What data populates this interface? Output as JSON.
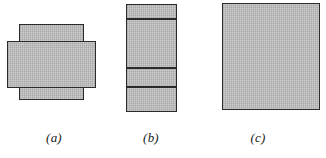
{
  "figure": {
    "type": "geometry-diagram",
    "background_color": "#ffffff",
    "fill_color": "#b5b5b5",
    "stroke_color": "#2b2b2b",
    "panels": [
      {
        "id": "a",
        "caption": "(a)",
        "caption_x": 38,
        "caption_y": 130,
        "caption_width": 32,
        "description": "two overlapping shaded rectangles",
        "shapes": [
          {
            "name": "tall-rectangle",
            "x": 19,
            "y": 24,
            "width": 65,
            "height": 76
          },
          {
            "name": "wide-rectangle",
            "x": 7,
            "y": 41,
            "width": 89,
            "height": 47
          }
        ],
        "dividers": []
      },
      {
        "id": "b",
        "caption": "(b)",
        "caption_x": 135,
        "caption_y": 130,
        "caption_width": 32,
        "description": "tall shaded rectangle split into four horizontal bands",
        "shapes": [
          {
            "name": "banded-rectangle",
            "x": 126,
            "y": 4,
            "width": 51,
            "height": 108
          }
        ],
        "dividers": [
          13,
          62,
          81
        ]
      },
      {
        "id": "c",
        "caption": "(c)",
        "caption_x": 242,
        "caption_y": 130,
        "caption_width": 32,
        "description": "single solid shaded rectangle",
        "shapes": [
          {
            "name": "solid-rectangle",
            "x": 222,
            "y": 3,
            "width": 98,
            "height": 107
          }
        ],
        "dividers": []
      }
    ]
  }
}
